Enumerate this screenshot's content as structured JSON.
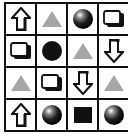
{
  "board": {
    "rows": 4,
    "cols": 4,
    "cells": [
      [
        "arrow-up",
        "triangle",
        "sphere",
        "cube"
      ],
      [
        "cube",
        "circle",
        "triangle",
        "arrow-down"
      ],
      [
        "triangle",
        "cube",
        "arrow-down",
        "triangle"
      ],
      [
        "arrow-up",
        "sphere",
        "square",
        "sphere"
      ]
    ]
  },
  "colors": {
    "grid_line": "#111111",
    "triangle": "#a6a6a6",
    "circle": "#111111",
    "square": "#111111"
  }
}
